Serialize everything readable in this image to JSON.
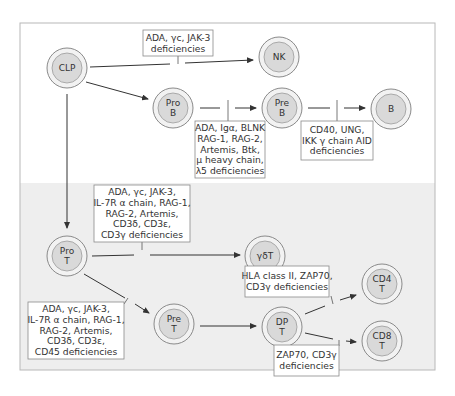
{
  "nodes": {
    "clp": {
      "lines": [
        "CLP"
      ]
    },
    "nk": {
      "lines": [
        "NK"
      ]
    },
    "prob": {
      "lines": [
        "Pro",
        "B"
      ]
    },
    "preb": {
      "lines": [
        "Pre",
        "B"
      ]
    },
    "b": {
      "lines": [
        "B"
      ]
    },
    "prot": {
      "lines": [
        "Pro",
        "T"
      ]
    },
    "gdt": {
      "lines": [
        "γδT"
      ]
    },
    "pret": {
      "lines": [
        "Pre",
        "T"
      ]
    },
    "dpt": {
      "lines": [
        "DP",
        "T"
      ]
    },
    "cd4t": {
      "lines": [
        "CD4",
        "T"
      ]
    },
    "cd8t": {
      "lines": [
        "CD8",
        "T"
      ]
    }
  },
  "blocks": {
    "clp_to_nk": {
      "lines": [
        "ADA, γc, JAK-3",
        "deficiencies"
      ]
    },
    "prob_to_preb": {
      "lines": [
        "ADA, Igα, BLNK",
        "RAG-1, RAG-2,",
        "Artemis, Btk,",
        "μ heavy chain,",
        "λ5 deficiencies"
      ]
    },
    "preb_to_b": {
      "lines": [
        "CD40, UNG,",
        "IKK γ chain AID",
        "deficiencies"
      ]
    },
    "prot_to_gdt": {
      "lines": [
        "ADA, γc, JAK-3,",
        "IL-7R α chain, RAG-1,",
        "RAG-2, Artemis,",
        "CD3δ, CD3ε,",
        "CD3γ deficiencies"
      ]
    },
    "prot_to_pret": {
      "lines": [
        "ADA, γc, JAK-3,",
        "IL-7R α chain, RAG-1,",
        "RAG-2, Artemis,",
        "CD3δ, CD3ε,",
        "CD45 deficiencies"
      ]
    },
    "dpt_to_cd4t": {
      "lines": [
        "HLA class II, ZAP70,",
        "CD3γ deficiencies"
      ]
    },
    "dpt_to_cd8t": {
      "lines": [
        "ZAP70, CD3γ",
        "deficiencies"
      ]
    }
  },
  "edges": [
    {
      "from": "clp",
      "to": "nk",
      "blocked": true
    },
    {
      "from": "clp",
      "to": "prob",
      "blocked": false
    },
    {
      "from": "clp",
      "to": "prot",
      "blocked": false
    },
    {
      "from": "prob",
      "to": "preb",
      "blocked": true
    },
    {
      "from": "preb",
      "to": "b",
      "blocked": true
    },
    {
      "from": "prot",
      "to": "gdt",
      "blocked": true
    },
    {
      "from": "prot",
      "to": "pret",
      "blocked": true
    },
    {
      "from": "pret",
      "to": "dpt",
      "blocked": false
    },
    {
      "from": "dpt",
      "to": "cd4t",
      "blocked": true
    },
    {
      "from": "dpt",
      "to": "cd8t",
      "blocked": true
    }
  ],
  "colors": {
    "node_fill": "#d9d9d9",
    "node_ring": "#f2f2f2",
    "lower_panel": "#eeeeee",
    "line": "#333333"
  }
}
